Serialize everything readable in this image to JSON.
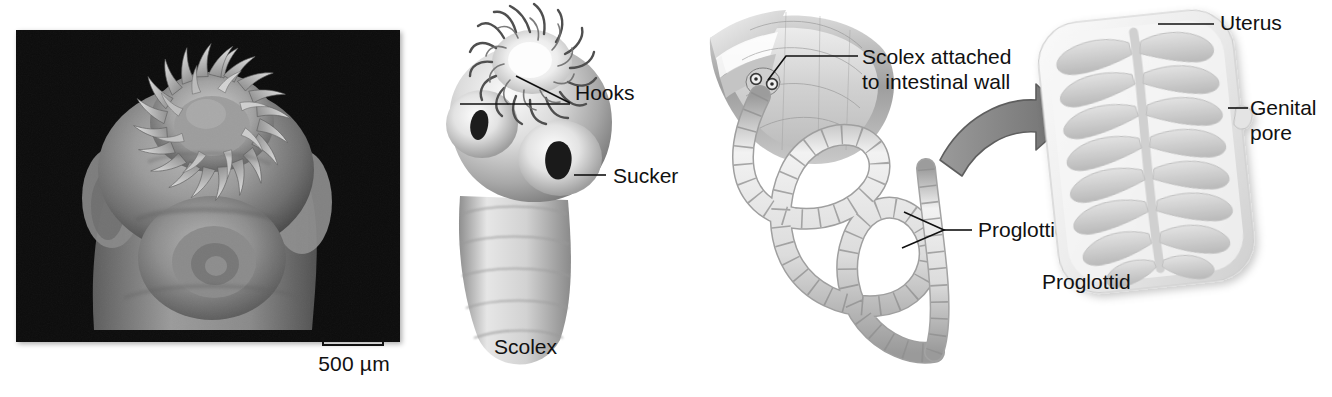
{
  "figure": {
    "background_color": "#ffffff",
    "text_color": "#111111"
  },
  "panels": [
    {
      "id": "micrograph",
      "kind": "sem-photograph",
      "subject": "tapeworm scolex",
      "background_color": "#0b0b0b",
      "scale_bar": {
        "label": "500 µm",
        "value": 500,
        "unit": "µm"
      }
    },
    {
      "id": "scolex-diagram",
      "kind": "illustration",
      "caption": "Scolex",
      "labels": [
        {
          "text": "Hooks",
          "leader": "wedge"
        },
        {
          "text": "Sucker",
          "leader": "line"
        }
      ]
    },
    {
      "id": "whole-worm",
      "kind": "illustration",
      "labels": [
        {
          "text": "Scolex attached\nto intestinal wall",
          "line1": "Scolex attached",
          "line2": "to intestinal wall",
          "leader": "bent-line"
        },
        {
          "text": "Proglottids",
          "leader": "wedge"
        }
      ],
      "arrow": {
        "name": "magnify-arrow",
        "color": "#8a8a8a",
        "direction": "right"
      }
    },
    {
      "id": "proglottid-detail",
      "kind": "illustration",
      "caption": "Proglottid",
      "labels": [
        {
          "text": "Uterus",
          "leader": "line"
        },
        {
          "text": "Genital\npore",
          "line1": "Genital",
          "line2": "pore",
          "leader": "line"
        }
      ]
    }
  ],
  "micrograph": {
    "scale_text": "500 µm"
  },
  "scolex_panel": {
    "hooks_label": "Hooks",
    "sucker_label": "Sucker",
    "caption": "Scolex"
  },
  "worm_panel": {
    "attach_label_line1": "Scolex attached",
    "attach_label_line2": "to intestinal wall",
    "proglottids_label": "Proglottids"
  },
  "proglottid_panel": {
    "uterus_label": "Uterus",
    "genital_label_line1": "Genital",
    "genital_label_line2": "pore",
    "caption": "Proglottid"
  },
  "colors": {
    "photo_background": "#0b0b0b",
    "arrow_gray": "#8a8a8a",
    "ink": "#111111",
    "tissue_light": "#e9e9e9",
    "tissue_mid": "#c2c2c2",
    "tissue_dark": "#8d8d8d"
  }
}
